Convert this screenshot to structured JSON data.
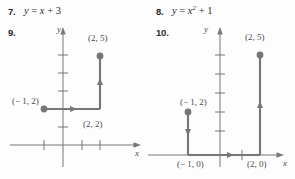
{
  "page": {
    "width": 295,
    "height": 179,
    "background": "#fdfdfd",
    "ink": "#6e6e6e",
    "text": "#3a3a3a"
  },
  "exercises": [
    {
      "number": "7.",
      "equation_parts": {
        "lhs": "y",
        "eq": " = ",
        "rhs": "x",
        "exponent": "",
        "tail": " + 3"
      },
      "equation_text": "y = x + 3"
    },
    {
      "number": "8.",
      "equation_parts": {
        "lhs": "y",
        "eq": " = ",
        "rhs": "x",
        "exponent": "2",
        "tail": " + 1"
      },
      "equation_text": "y = x² + 1"
    }
  ],
  "graphs": [
    {
      "number": "9.",
      "y_axis_label": "y",
      "x_axis_label": "x",
      "y_tick_count": 5,
      "x_tick_count_right": 2,
      "x_tick_count_left": 1,
      "points": [
        {
          "label": "(− 1, 2)",
          "x": -1,
          "y": 2,
          "dot": true
        },
        {
          "label": "(2, 2)",
          "x": 2,
          "y": 2,
          "dot": false
        },
        {
          "label": "(2, 5)",
          "x": 2,
          "y": 5,
          "dot": true
        }
      ],
      "path_description": "horizontal arrow right from (-1,2) to (2,2), then vertical arrow up from (2,2) to (2,5)"
    },
    {
      "number": "10.",
      "y_axis_label": "y",
      "x_axis_label": "x",
      "y_tick_count": 6,
      "x_tick_count_right": 1,
      "points": [
        {
          "label": "(− 1, 2)",
          "x": -1,
          "y": 2,
          "dot": true
        },
        {
          "label": "(− 1, 0)",
          "x": -1,
          "y": 0,
          "dot": false
        },
        {
          "label": "(2, 0)",
          "x": 2,
          "y": 0,
          "dot": false
        },
        {
          "label": "(2, 5)",
          "x": 2,
          "y": 5,
          "dot": true
        }
      ],
      "path_description": "vertical arrow down from (-1,2) to (-1,0), horizontal arrow right along axis to (2,0), vertical arrow up to (2,5)"
    }
  ]
}
